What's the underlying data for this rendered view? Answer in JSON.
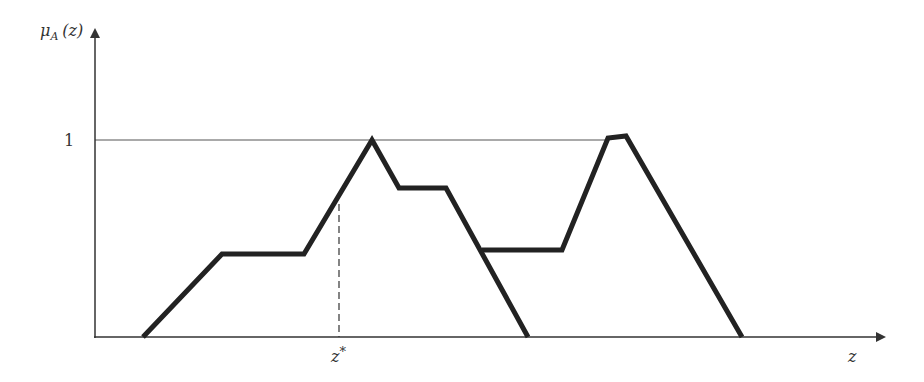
{
  "diagram": {
    "type": "fuzzy-membership-function",
    "y_axis_label": "μ",
    "y_axis_label_sub": "A",
    "y_axis_label_arg": "(z)",
    "x_axis_label": "z",
    "y_tick_label": "1",
    "marker_label": "z",
    "marker_label_sup": "*",
    "colors": {
      "curve": "#222222",
      "axis": "#333333",
      "reference_line": "#555555",
      "text": "#333333",
      "background": "#ffffff"
    },
    "axes": {
      "origin": [
        95,
        337
      ],
      "y_axis_top": 28,
      "x_axis_right": 886,
      "one_level_y": 140,
      "one_level_line_end_x": 610
    },
    "curves": [
      {
        "name": "membership-curve-1",
        "points": "143,337 222,254 304,254 372,140 399,188 446,188 528,337"
      },
      {
        "name": "membership-curve-2",
        "points": "482,250 562,250 608,138 626,136 742,337"
      }
    ],
    "marker": {
      "x": 339,
      "y_top": 204,
      "y_bottom": 337
    }
  }
}
